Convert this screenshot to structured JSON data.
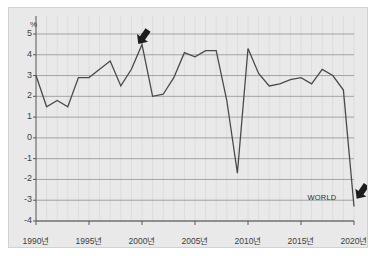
{
  "figure": {
    "background_color": "#ffffff",
    "plot_background_color": "#e9e9e9",
    "plot_border_color": "#d2d2d2"
  },
  "chart_data": {
    "type": "line",
    "title": "",
    "subtitle": "",
    "xlabel": "",
    "ylabel": "",
    "unit_label": "%",
    "grid": true,
    "grid_color": "#8f8f8f",
    "legend_position": "inline-annotation",
    "line_color": "#4a4a4a",
    "xlim": [
      1990,
      2020
    ],
    "ylim": [
      -4,
      5
    ],
    "ytick_labels": [
      "5",
      "4",
      "3",
      "2",
      "1",
      "0",
      "-1",
      "-2",
      "-3",
      "-4"
    ],
    "ytick_values": [
      5,
      4,
      3,
      2,
      1,
      0,
      -1,
      -2,
      -3,
      -4
    ],
    "xtick_labels": [
      "1990년",
      "1995년",
      "2000년",
      "2005년",
      "2010년",
      "2015년",
      "2020년"
    ],
    "xtick_values": [
      1990,
      1995,
      2000,
      2005,
      2010,
      2015,
      2020
    ],
    "series": [
      {
        "name": "WORLD",
        "x": [
          1990,
          1991,
          1992,
          1993,
          1994,
          1995,
          1996,
          1997,
          1998,
          1999,
          2000,
          2001,
          2002,
          2003,
          2004,
          2005,
          2006,
          2007,
          2008,
          2009,
          2010,
          2011,
          2012,
          2013,
          2014,
          2015,
          2016,
          2017,
          2018,
          2019,
          2020
        ],
        "values": [
          3.0,
          1.5,
          1.8,
          1.5,
          2.9,
          2.9,
          3.3,
          3.7,
          2.5,
          3.3,
          4.5,
          2.0,
          2.1,
          2.9,
          4.1,
          3.9,
          4.2,
          4.2,
          1.8,
          -1.7,
          4.3,
          3.1,
          2.5,
          2.6,
          2.8,
          2.9,
          2.6,
          3.3,
          3.0,
          2.3,
          -3.3
        ]
      }
    ],
    "annotations": [
      {
        "name": "series-label",
        "text": "WORLD",
        "x": 2017.5,
        "y": -2.9
      },
      {
        "name": "arrow-peak-2000",
        "text": "▼",
        "x": 2000,
        "y": 4.9
      },
      {
        "name": "arrow-end-2020",
        "text": "▼",
        "x": 2020.6,
        "y": -2.55
      }
    ]
  }
}
